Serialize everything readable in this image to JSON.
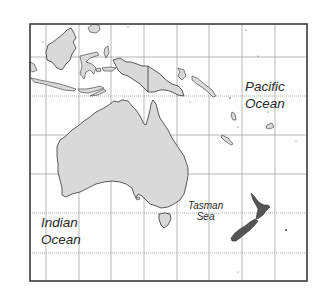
{
  "map": {
    "region": "Australia and Oceania",
    "labels": {
      "pacific_line1": "Pacific",
      "pacific_line2": "Ocean",
      "indian_line1": "Indian",
      "indian_line2": "Ocean",
      "tasman_line1": "Tasman",
      "tasman_line2": "Sea"
    },
    "colors": {
      "land": "#d9d9d9",
      "new_zealand": "#555555",
      "frame": "#3a3a3a",
      "grid": "#9a9a9a",
      "background": "#ffffff"
    },
    "frame": {
      "x": 30,
      "y": 24,
      "width": 277,
      "height": 257
    },
    "grid": {
      "vertical_x": [
        46,
        79,
        111,
        144,
        177,
        209,
        242,
        275
      ],
      "horizontal_y": [
        57,
        96,
        135,
        174,
        213,
        253
      ]
    },
    "landmasses": [
      "Australia",
      "Tasmania",
      "New Guinea",
      "Borneo",
      "Sulawesi",
      "Java",
      "Sumatra",
      "New Zealand",
      "Solomon Islands",
      "Vanuatu",
      "New Caledonia",
      "Fiji"
    ]
  }
}
